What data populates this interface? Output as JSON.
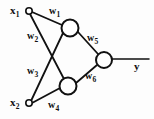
{
  "diagram": {
    "type": "neural-network-graph",
    "stroke_color": "#111111",
    "node_fill": "#ffffff",
    "background": "#fdfdfd",
    "inputs": [
      {
        "id": "x1",
        "base": "x",
        "sub": "1",
        "cx": 29,
        "cy": 11,
        "r": 3.2
      },
      {
        "id": "x2",
        "base": "x",
        "sub": "2",
        "cx": 29,
        "cy": 103,
        "r": 3.2
      }
    ],
    "hidden": [
      {
        "id": "h1",
        "cx": 70,
        "cy": 28,
        "r": 8.5
      },
      {
        "id": "h2",
        "cx": 68,
        "cy": 86,
        "r": 8.5
      }
    ],
    "output_node": {
      "id": "o1",
      "cx": 104,
      "cy": 60,
      "r": 8.0
    },
    "output_label": {
      "base": "y",
      "sub": "",
      "x": 134,
      "y": 62
    },
    "output_line": {
      "x1": 112,
      "y1": 59,
      "x2": 149,
      "y2": 59
    },
    "weights": [
      {
        "id": "w1",
        "base": "w",
        "sub": "1",
        "x": 49,
        "y": 8,
        "from": "x1",
        "to": "h1"
      },
      {
        "id": "w2",
        "base": "w",
        "sub": "2",
        "x": 27,
        "y": 31,
        "from": "x1",
        "to": "h2"
      },
      {
        "id": "w3",
        "base": "w",
        "sub": "3",
        "x": 27,
        "y": 67,
        "from": "x2",
        "to": "h1"
      },
      {
        "id": "w4",
        "base": "w",
        "sub": "4",
        "x": 48,
        "y": 101,
        "from": "x2",
        "to": "h2"
      },
      {
        "id": "w5",
        "base": "w",
        "sub": "5",
        "x": 87,
        "y": 34,
        "from": "h1",
        "to": "o1"
      },
      {
        "id": "w6",
        "base": "w",
        "sub": "6",
        "x": 85,
        "y": 72,
        "from": "h2",
        "to": "o1"
      }
    ],
    "edges": [
      {
        "id": "e-x1-h1",
        "x1": 32,
        "y1": 12,
        "x2": 62,
        "y2": 25
      },
      {
        "id": "e-x1-h2",
        "x1": 30,
        "y1": 14,
        "x2": 64,
        "y2": 79
      },
      {
        "id": "e-x2-h1",
        "x1": 31,
        "y1": 101,
        "x2": 63,
        "y2": 33
      },
      {
        "id": "e-x2-h2",
        "x1": 32,
        "y1": 103,
        "x2": 60,
        "y2": 88
      },
      {
        "id": "e-h1-o1",
        "x1": 78,
        "y1": 32,
        "x2": 98,
        "y2": 54
      },
      {
        "id": "e-h2-o1",
        "x1": 76,
        "y1": 83,
        "x2": 97,
        "y2": 65
      }
    ]
  }
}
